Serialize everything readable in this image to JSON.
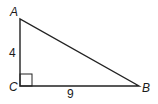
{
  "figure": {
    "type": "right-triangle",
    "vertices": [
      {
        "name": "A",
        "x": 20,
        "y": 19
      },
      {
        "name": "C",
        "x": 20,
        "y": 86
      },
      {
        "name": "B",
        "x": 139,
        "y": 86
      }
    ],
    "right_angle_at": "C",
    "side_labels": {
      "AC": "4",
      "CB": "9"
    },
    "vertex_labels": {
      "A": "A",
      "B": "B",
      "C": "C"
    },
    "stroke_color": "#222222"
  }
}
